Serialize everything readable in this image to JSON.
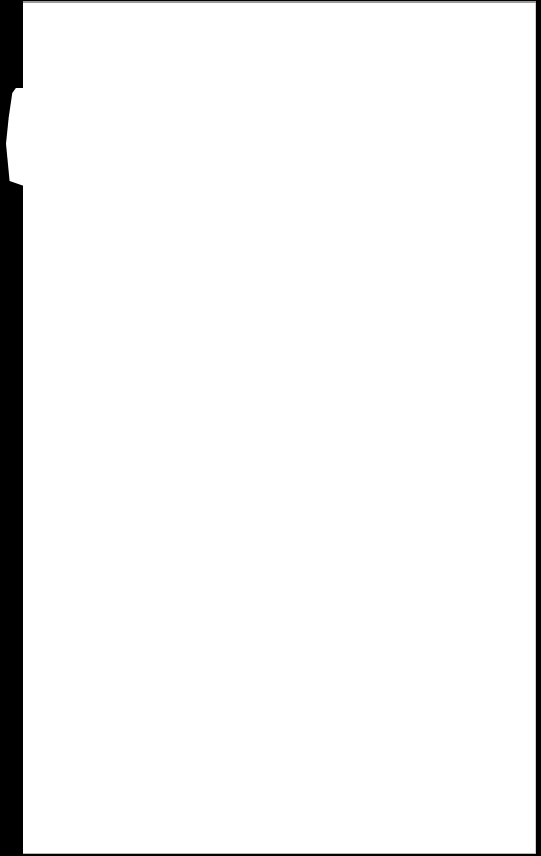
{
  "screen": {
    "background_color": "#000000",
    "page_color": "#ffffff",
    "page_border_color": "#9a9a9a"
  },
  "page": {
    "content": ""
  },
  "side_tab": {
    "color": "#ffffff"
  }
}
